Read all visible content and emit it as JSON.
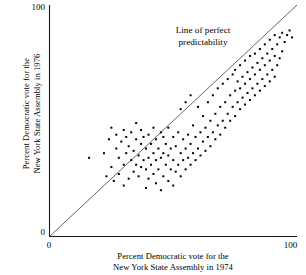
{
  "axes": {
    "y_title_line1": "Percent Democratic vote for the",
    "y_title_line2": "New York State Assembly in 1976",
    "x_title_line1": "Percent Democratic vote for the",
    "x_title_line2": "New York State Assembly in 1974",
    "y_tick_top": "100",
    "y_tick_bottom": "0",
    "x_tick_left": "0",
    "x_tick_right": "100"
  },
  "annotation": {
    "line1": "Line of perfect",
    "line2": "predictability"
  },
  "chart_data": {
    "type": "scatter",
    "title": "",
    "xlabel": "Percent Democratic vote for the New York State Assembly in 1974",
    "ylabel": "Percent Democratic vote for the New York State Assembly in 1976",
    "xlim": [
      0,
      100
    ],
    "ylim": [
      0,
      100
    ],
    "xticks": [
      0,
      100
    ],
    "yticks": [
      0,
      100
    ],
    "grid": false,
    "legend": null,
    "annotations": [
      {
        "text": "Line of perfect predictability",
        "x": 41,
        "y": 90,
        "refers_to": "identity-line"
      }
    ],
    "reference_line": {
      "name": "Line of perfect predictability",
      "type": "identity",
      "slope": 1,
      "intercept": 0,
      "from": [
        0,
        0
      ],
      "to": [
        100,
        100
      ],
      "color": "#555555"
    },
    "marker": {
      "shape": "square",
      "size_px": 2,
      "color": "#000000"
    },
    "points": [
      [
        16,
        34
      ],
      [
        22,
        36
      ],
      [
        23,
        26
      ],
      [
        24,
        42
      ],
      [
        25,
        30
      ],
      [
        25,
        47
      ],
      [
        26,
        24
      ],
      [
        27,
        38
      ],
      [
        27,
        44
      ],
      [
        28,
        27
      ],
      [
        28,
        34
      ],
      [
        29,
        41
      ],
      [
        30,
        22
      ],
      [
        30,
        31
      ],
      [
        30,
        46
      ],
      [
        31,
        36
      ],
      [
        31,
        43
      ],
      [
        32,
        25
      ],
      [
        32,
        39
      ],
      [
        33,
        33
      ],
      [
        33,
        45
      ],
      [
        34,
        28
      ],
      [
        34,
        37
      ],
      [
        35,
        31
      ],
      [
        35,
        42
      ],
      [
        35,
        49
      ],
      [
        36,
        26
      ],
      [
        36,
        35
      ],
      [
        37,
        30
      ],
      [
        37,
        40
      ],
      [
        37,
        46
      ],
      [
        38,
        33
      ],
      [
        38,
        43
      ],
      [
        39,
        21
      ],
      [
        39,
        29
      ],
      [
        39,
        38
      ],
      [
        40,
        25
      ],
      [
        40,
        34
      ],
      [
        40,
        44
      ],
      [
        41,
        31
      ],
      [
        41,
        40
      ],
      [
        42,
        27
      ],
      [
        42,
        36
      ],
      [
        42,
        47
      ],
      [
        43,
        23
      ],
      [
        43,
        33
      ],
      [
        43,
        42
      ],
      [
        44,
        29
      ],
      [
        44,
        38
      ],
      [
        45,
        20
      ],
      [
        45,
        34
      ],
      [
        45,
        45
      ],
      [
        46,
        26
      ],
      [
        46,
        36
      ],
      [
        46,
        43
      ],
      [
        47,
        31
      ],
      [
        47,
        40
      ],
      [
        48,
        24
      ],
      [
        48,
        35
      ],
      [
        48,
        47
      ],
      [
        49,
        29
      ],
      [
        49,
        38
      ],
      [
        50,
        22
      ],
      [
        50,
        33
      ],
      [
        50,
        43
      ],
      [
        51,
        28
      ],
      [
        51,
        39
      ],
      [
        52,
        31
      ],
      [
        52,
        45
      ],
      [
        53,
        26
      ],
      [
        53,
        36
      ],
      [
        53,
        55
      ],
      [
        54,
        33
      ],
      [
        54,
        42
      ],
      [
        55,
        29
      ],
      [
        55,
        38
      ],
      [
        55,
        58
      ],
      [
        56,
        34
      ],
      [
        56,
        44
      ],
      [
        57,
        31
      ],
      [
        57,
        40
      ],
      [
        57,
        61
      ],
      [
        58,
        36
      ],
      [
        58,
        48
      ],
      [
        59,
        33
      ],
      [
        59,
        43
      ],
      [
        60,
        38
      ],
      [
        60,
        56
      ],
      [
        61,
        35
      ],
      [
        61,
        45
      ],
      [
        62,
        41
      ],
      [
        62,
        52
      ],
      [
        63,
        37
      ],
      [
        63,
        47
      ],
      [
        64,
        43
      ],
      [
        64,
        58
      ],
      [
        65,
        39
      ],
      [
        65,
        50
      ],
      [
        66,
        45
      ],
      [
        66,
        61
      ],
      [
        67,
        42
      ],
      [
        67,
        53
      ],
      [
        68,
        48
      ],
      [
        68,
        64
      ],
      [
        69,
        44
      ],
      [
        69,
        56
      ],
      [
        70,
        50
      ],
      [
        70,
        66
      ],
      [
        71,
        47
      ],
      [
        71,
        58
      ],
      [
        72,
        53
      ],
      [
        72,
        68
      ],
      [
        73,
        50
      ],
      [
        73,
        61
      ],
      [
        74,
        56
      ],
      [
        74,
        70
      ],
      [
        75,
        52
      ],
      [
        75,
        63
      ],
      [
        75,
        72
      ],
      [
        76,
        58
      ],
      [
        76,
        67
      ],
      [
        77,
        55
      ],
      [
        77,
        64
      ],
      [
        77,
        74
      ],
      [
        78,
        60
      ],
      [
        78,
        69
      ],
      [
        79,
        57
      ],
      [
        79,
        66
      ],
      [
        79,
        76
      ],
      [
        80,
        62
      ],
      [
        80,
        71
      ],
      [
        81,
        59
      ],
      [
        81,
        68
      ],
      [
        81,
        78
      ],
      [
        82,
        64
      ],
      [
        82,
        73
      ],
      [
        83,
        61
      ],
      [
        83,
        70
      ],
      [
        83,
        79
      ],
      [
        84,
        66
      ],
      [
        84,
        75
      ],
      [
        85,
        63
      ],
      [
        85,
        72
      ],
      [
        85,
        81
      ],
      [
        86,
        68
      ],
      [
        86,
        77
      ],
      [
        87,
        65
      ],
      [
        87,
        74
      ],
      [
        87,
        83
      ],
      [
        88,
        70
      ],
      [
        88,
        79
      ],
      [
        89,
        67
      ],
      [
        89,
        76
      ],
      [
        89,
        85
      ],
      [
        90,
        72
      ],
      [
        90,
        81
      ],
      [
        91,
        69
      ],
      [
        91,
        78
      ],
      [
        91,
        87
      ],
      [
        92,
        74
      ],
      [
        92,
        83
      ],
      [
        93,
        77
      ],
      [
        93,
        86
      ],
      [
        94,
        80
      ],
      [
        94,
        88
      ],
      [
        95,
        84
      ],
      [
        96,
        87
      ],
      [
        97,
        89
      ],
      [
        98,
        86
      ]
    ]
  }
}
